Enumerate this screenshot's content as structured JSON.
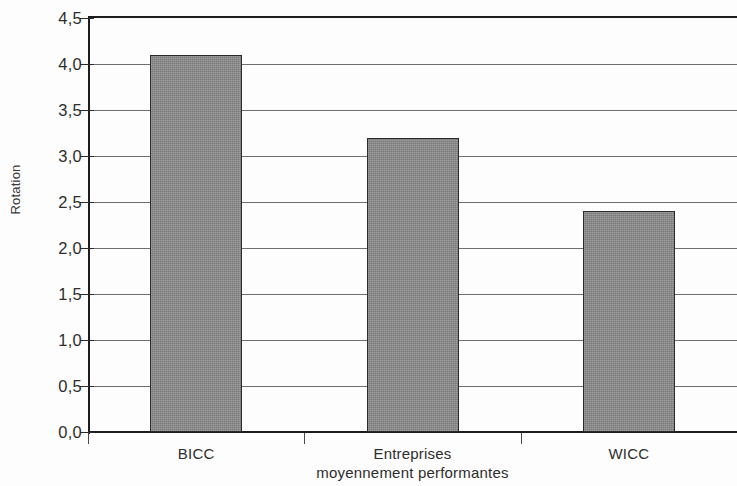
{
  "chart_data": {
    "type": "bar",
    "title": "",
    "xlabel": "",
    "ylabel": "Rotation",
    "categories": [
      "BICC",
      "Entreprises moyennement performantes",
      "WICC"
    ],
    "category_lines": [
      [
        "BICC"
      ],
      [
        "Entreprises",
        "moyennement  performantes"
      ],
      [
        "WICC"
      ]
    ],
    "values": [
      4.1,
      3.2,
      2.4
    ],
    "value_labels": [
      "4,1",
      "3,2",
      "2,4"
    ],
    "ylim": [
      0.0,
      4.5
    ],
    "ytick_values": [
      0.0,
      0.5,
      1.0,
      1.5,
      2.0,
      2.5,
      3.0,
      3.5,
      4.0,
      4.5
    ],
    "ytick_labels": [
      "0,0",
      "0,5",
      "1,0",
      "1,5",
      "2,0",
      "2,5",
      "3,0",
      "3,5",
      "4,0",
      "4,5"
    ],
    "grid": true,
    "grid_axis": "y",
    "legend": false,
    "legend_position": "none",
    "decimal_separator": ",",
    "bar_fill_color": "#8a8a8a",
    "bar_border_color": "#2b2b2b",
    "grid_color": "#6f6f6f",
    "axis_color": "#1d1d1d",
    "text_color": "#2e2e2e",
    "background_color": "#fdfdfd"
  }
}
